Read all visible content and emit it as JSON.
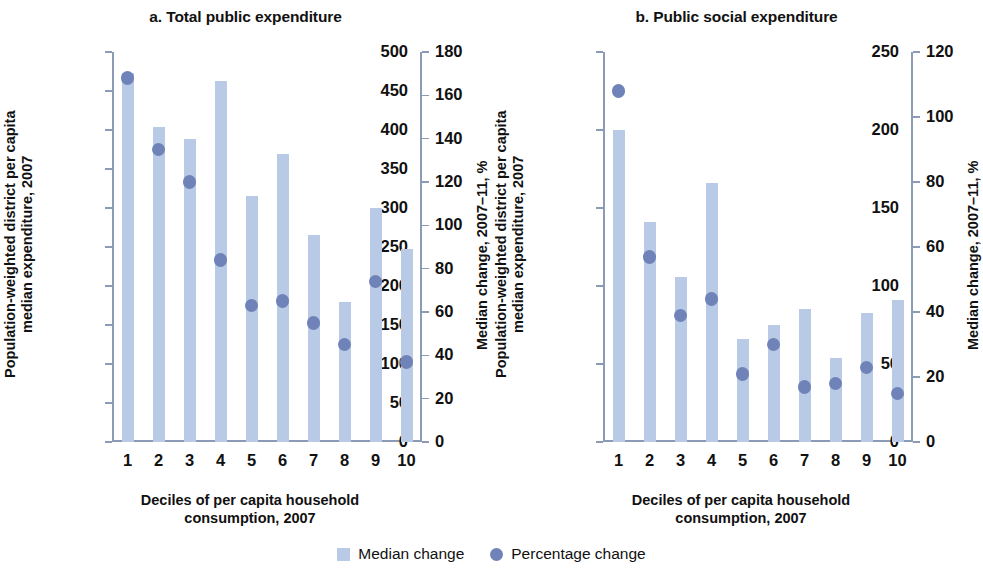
{
  "figure": {
    "legend": [
      {
        "marker": "square-swatch",
        "label": "Median change",
        "color": "#b8cae6"
      },
      {
        "marker": "circle-swatch",
        "label": "Percentage change",
        "color": "#6f83b8"
      }
    ]
  },
  "chart_data": [
    {
      "type": "bar",
      "panel": "a",
      "title": "a. Total public expenditure",
      "xlabel": "Deciles of per capita household consumption, 2007",
      "xlabel_line1": "Deciles of per capita household",
      "xlabel_line2": "consumption, 2007",
      "ylabel": "Population-weighted district per capita median expenditure, 2007",
      "ylabel_line1": "Population-weighted district per capita",
      "ylabel_line2": "median expenditure, 2007",
      "y2label": "Median change, 2007–11, %",
      "categories": [
        "1",
        "2",
        "3",
        "4",
        "5",
        "6",
        "7",
        "8",
        "9",
        "10"
      ],
      "ylim": [
        0,
        500
      ],
      "yticks": [
        0,
        50,
        100,
        150,
        200,
        250,
        300,
        350,
        400,
        450,
        500
      ],
      "y2lim": [
        0,
        180
      ],
      "y2ticks": [
        0,
        20,
        40,
        60,
        80,
        100,
        120,
        140,
        160,
        180
      ],
      "grid": false,
      "legend_position": "bottom",
      "series": [
        {
          "name": "Median change",
          "kind": "bar",
          "axis": "left",
          "color": "#b8cae6",
          "values": [
            473,
            404,
            388,
            463,
            315,
            369,
            265,
            179,
            300,
            247
          ]
        },
        {
          "name": "Percentage change",
          "kind": "scatter",
          "axis": "right",
          "color": "#6f83b8",
          "values": [
            168,
            135,
            120,
            84,
            63,
            65,
            55,
            45,
            74,
            37
          ]
        }
      ]
    },
    {
      "type": "bar",
      "panel": "b",
      "title": "b. Public social expenditure",
      "xlabel": "Deciles of per capita household consumption, 2007",
      "xlabel_line1": "Deciles of per capita household",
      "xlabel_line2": "consumption, 2007",
      "ylabel": "Population-weighted district per capita median expenditure, 2007",
      "ylabel_line1": "Population-weighted district per capita",
      "ylabel_line2": "median expenditure, 2007",
      "y2label": "Median change, 2007–11, %",
      "categories": [
        "1",
        "2",
        "3",
        "4",
        "5",
        "6",
        "7",
        "8",
        "9",
        "10"
      ],
      "ylim": [
        0,
        250
      ],
      "yticks": [
        0,
        50,
        100,
        150,
        200,
        250
      ],
      "y2lim": [
        0,
        120
      ],
      "y2ticks": [
        0,
        20,
        40,
        60,
        80,
        100,
        120
      ],
      "grid": false,
      "legend_position": "bottom",
      "series": [
        {
          "name": "Median change",
          "kind": "bar",
          "axis": "left",
          "color": "#b8cae6",
          "values": [
            200,
            141,
            106,
            166,
            66,
            75,
            85,
            54,
            83,
            91
          ]
        },
        {
          "name": "Percentage change",
          "kind": "scatter",
          "axis": "right",
          "color": "#6f83b8",
          "values": [
            108,
            57,
            39,
            44,
            21,
            30,
            17,
            18,
            23,
            15
          ]
        }
      ]
    }
  ]
}
